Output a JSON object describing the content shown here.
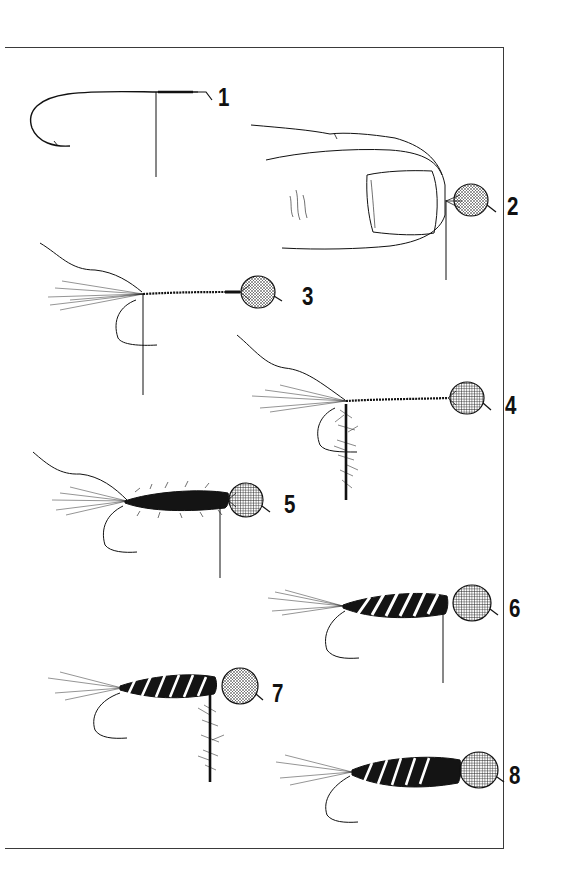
{
  "figure": {
    "border_color": "#3a3a3a",
    "ink_color": "#111111"
  },
  "steps": [
    {
      "number": "1",
      "label_pos": [
        218,
        87
      ],
      "content": "bare hook with thread wraps"
    },
    {
      "number": "2",
      "label_pos": [
        507,
        196
      ],
      "content": "fingertip holding bead eye at hook"
    },
    {
      "number": "3",
      "label_pos": [
        302,
        286
      ],
      "content": "tail tied in, thread wrapped to eye"
    },
    {
      "number": "4",
      "label_pos": [
        505,
        395
      ],
      "content": "dubbing applied to thread"
    },
    {
      "number": "5",
      "label_pos": [
        284,
        494
      ],
      "content": "dubbed body wrapped"
    },
    {
      "number": "6",
      "label_pos": [
        509,
        598
      ],
      "content": "ribbing wrapped over body"
    },
    {
      "number": "7",
      "label_pos": [
        272,
        683
      ],
      "content": "additional dubbing for thorax"
    },
    {
      "number": "8",
      "label_pos": [
        509,
        765
      ],
      "content": "finished fly"
    }
  ]
}
